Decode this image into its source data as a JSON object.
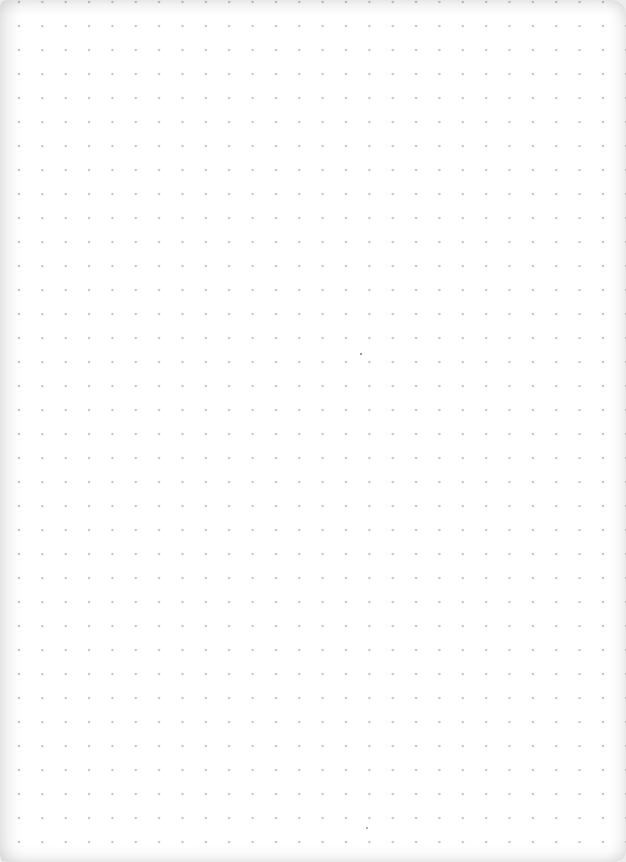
{
  "page": {
    "grid": {
      "columns": 26,
      "rows": 35,
      "dot_color": "#c4c4c4",
      "paper_color": "#ffffff",
      "edge_color": "#ececec"
    },
    "marks": [
      {
        "name": "speck",
        "x": 360,
        "y": 354
      },
      {
        "name": "speck",
        "x": 366,
        "y": 828
      }
    ]
  }
}
